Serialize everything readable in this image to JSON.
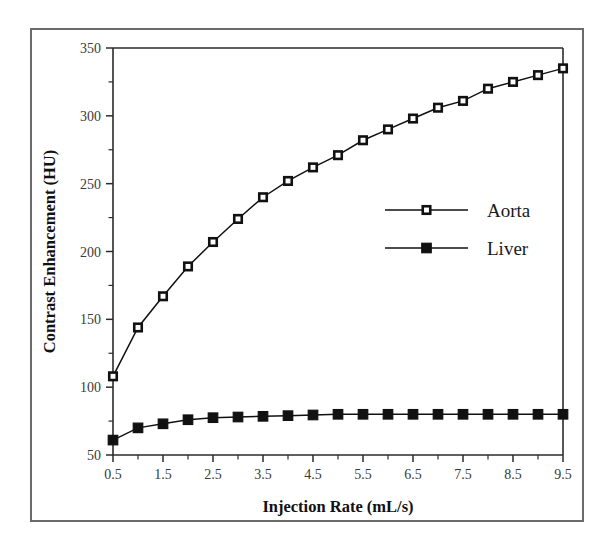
{
  "figure": {
    "background_color": "#ffffff",
    "frame_color": "#6b6b6b",
    "ink_color": "#111111"
  },
  "chart_data": {
    "type": "line",
    "title": "",
    "xlabel": "Injection Rate (mL/s)",
    "ylabel": "Contrast Enhancement (HU)",
    "xlim": [
      0.5,
      9.5
    ],
    "ylim": [
      50,
      350
    ],
    "xticks": [
      0.5,
      1.5,
      2.5,
      3.5,
      4.5,
      5.5,
      6.5,
      7.5,
      8.5,
      9.5
    ],
    "xtick_labels": [
      "0.5",
      "1.5",
      "2.5",
      "3.5",
      "4.5",
      "5.5",
      "6.5",
      "7.5",
      "8.5",
      "9.5"
    ],
    "yticks": [
      50,
      100,
      150,
      200,
      250,
      300,
      350
    ],
    "ytick_labels": [
      "50",
      "100",
      "150",
      "200",
      "250",
      "300",
      "350"
    ],
    "x": [
      0.5,
      1.0,
      1.5,
      2.0,
      2.5,
      3.0,
      3.5,
      4.0,
      4.5,
      5.0,
      5.5,
      6.0,
      6.5,
      7.0,
      7.5,
      8.0,
      8.5,
      9.0,
      9.5
    ],
    "grid": false,
    "legend_position": "center-right",
    "series": [
      {
        "name": "Aorta",
        "marker": "open-square",
        "values": [
          108,
          144,
          167,
          189,
          207,
          224,
          240,
          252,
          262,
          271,
          282,
          290,
          298,
          306,
          311,
          320,
          325,
          330,
          335
        ]
      },
      {
        "name": "Liver",
        "marker": "filled-square",
        "values": [
          61,
          70,
          73,
          76,
          77.5,
          78,
          78.5,
          79,
          79.5,
          80,
          80,
          80,
          80,
          80,
          80,
          80,
          80,
          80,
          80
        ]
      }
    ]
  },
  "legend": {
    "entries": [
      {
        "label": "Aorta",
        "marker": "open-square"
      },
      {
        "label": "Liver",
        "marker": "filled-square"
      }
    ]
  }
}
